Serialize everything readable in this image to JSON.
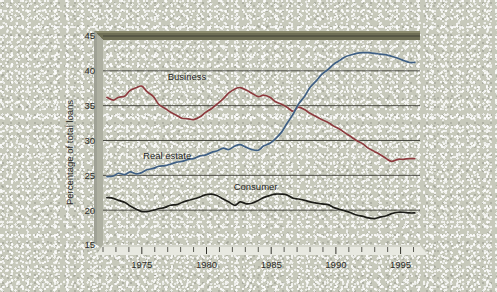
{
  "chart_data": {
    "type": "line",
    "title": "",
    "xlabel": "",
    "ylabel": "Percentage of total loans",
    "xlim": [
      1972,
      1996.5
    ],
    "ylim": [
      15,
      45
    ],
    "ytick_values": [
      15,
      20,
      25,
      30,
      35,
      40,
      45
    ],
    "ytick_labels": [
      "15",
      "20",
      "25",
      "30",
      "35",
      "40",
      "45"
    ],
    "xtick_values": [
      1975,
      1980,
      1985,
      1990,
      1995
    ],
    "xtick_labels": [
      "1975",
      "1980",
      "1985",
      "1990",
      "1995"
    ],
    "xminor_step": 1,
    "grid": "horizontal",
    "legend_position": "inline-annotations",
    "series": [
      {
        "name": "Business",
        "color": "#8c3b3e",
        "label_x": 1977.0,
        "label_y": 38.7,
        "x": [
          1972.3,
          1972.8,
          1973.2,
          1973.7,
          1974.1,
          1974.6,
          1975.0,
          1975.4,
          1975.9,
          1976.3,
          1976.8,
          1977.2,
          1977.7,
          1978.1,
          1978.6,
          1979.0,
          1979.5,
          1979.9,
          1980.4,
          1980.8,
          1981.3,
          1981.7,
          1982.2,
          1982.6,
          1983.1,
          1983.5,
          1984.0,
          1984.4,
          1984.9,
          1985.3,
          1985.8,
          1986.2,
          1986.7,
          1987.1,
          1987.6,
          1988.0,
          1988.5,
          1988.9,
          1989.4,
          1989.8,
          1990.3,
          1990.7,
          1991.2,
          1991.6,
          1992.1,
          1992.5,
          1993.0,
          1993.4,
          1993.9,
          1994.3,
          1994.8,
          1995.2,
          1995.7,
          1996.1
        ],
        "y": [
          36.2,
          35.8,
          36.2,
          36.4,
          37.2,
          37.6,
          37.8,
          37.0,
          36.3,
          35.2,
          34.6,
          34.1,
          33.6,
          33.2,
          33.1,
          33.0,
          33.4,
          34.0,
          34.6,
          35.2,
          36.0,
          36.8,
          37.4,
          37.6,
          37.2,
          36.8,
          36.3,
          36.5,
          36.2,
          35.6,
          35.2,
          34.8,
          34.2,
          34.8,
          34.4,
          33.9,
          33.4,
          33.0,
          32.6,
          32.1,
          31.6,
          31.1,
          30.5,
          30.0,
          29.5,
          28.9,
          28.4,
          28.0,
          27.4,
          27.0,
          27.3,
          27.3,
          27.4,
          27.4
        ]
      },
      {
        "name": "Real estate",
        "color": "#3f5f84",
        "label_x": 1975.1,
        "label_y": 27.4,
        "x": [
          1972.3,
          1972.8,
          1973.2,
          1973.7,
          1974.1,
          1974.6,
          1975.0,
          1975.4,
          1975.9,
          1976.3,
          1976.8,
          1977.2,
          1977.7,
          1978.1,
          1978.6,
          1979.0,
          1979.5,
          1979.9,
          1980.4,
          1980.8,
          1981.3,
          1981.7,
          1982.2,
          1982.6,
          1983.1,
          1983.5,
          1984.0,
          1984.4,
          1984.9,
          1985.3,
          1985.8,
          1986.2,
          1986.7,
          1987.1,
          1987.6,
          1988.0,
          1988.5,
          1988.9,
          1989.4,
          1989.8,
          1990.3,
          1990.7,
          1991.2,
          1991.6,
          1992.1,
          1992.5,
          1993.0,
          1993.4,
          1993.9,
          1994.3,
          1994.8,
          1995.2,
          1995.7,
          1996.1
        ],
        "y": [
          24.8,
          24.9,
          25.3,
          25.1,
          25.5,
          25.2,
          25.4,
          25.8,
          26.0,
          26.3,
          26.4,
          26.6,
          26.9,
          27.0,
          27.3,
          27.4,
          27.8,
          27.9,
          28.3,
          28.5,
          28.9,
          28.7,
          29.2,
          29.4,
          29.0,
          28.7,
          28.6,
          29.2,
          29.6,
          30.2,
          31.2,
          32.4,
          33.8,
          35.2,
          36.4,
          37.6,
          38.6,
          39.5,
          40.2,
          40.9,
          41.5,
          42.0,
          42.3,
          42.5,
          42.6,
          42.6,
          42.5,
          42.4,
          42.3,
          42.1,
          41.8,
          41.5,
          41.2,
          41.2
        ]
      },
      {
        "name": "Consumer",
        "color": "#1d1d18",
        "label_x": 1982.1,
        "label_y": 22.9,
        "x": [
          1972.3,
          1972.8,
          1973.2,
          1973.7,
          1974.1,
          1974.6,
          1975.0,
          1975.4,
          1975.9,
          1976.3,
          1976.8,
          1977.2,
          1977.7,
          1978.1,
          1978.6,
          1979.0,
          1979.5,
          1979.9,
          1980.4,
          1980.8,
          1981.3,
          1981.7,
          1982.2,
          1982.6,
          1983.1,
          1983.5,
          1984.0,
          1984.4,
          1984.9,
          1985.3,
          1985.8,
          1986.2,
          1986.7,
          1987.1,
          1987.6,
          1988.0,
          1988.5,
          1988.9,
          1989.4,
          1989.8,
          1990.3,
          1990.7,
          1991.2,
          1991.6,
          1992.1,
          1992.5,
          1993.0,
          1993.4,
          1993.9,
          1994.3,
          1994.8,
          1995.2,
          1995.7,
          1996.1
        ],
        "y": [
          21.8,
          21.7,
          21.4,
          21.1,
          20.6,
          20.1,
          19.8,
          19.8,
          20.0,
          20.2,
          20.4,
          20.7,
          20.8,
          21.1,
          21.4,
          21.6,
          21.9,
          22.2,
          22.3,
          22.1,
          21.6,
          21.2,
          20.7,
          21.2,
          20.9,
          21.0,
          21.4,
          21.8,
          22.1,
          22.3,
          22.3,
          22.2,
          21.7,
          21.6,
          21.4,
          21.2,
          21.0,
          20.9,
          20.8,
          20.4,
          20.1,
          19.9,
          19.6,
          19.3,
          19.1,
          18.9,
          18.8,
          19.0,
          19.2,
          19.5,
          19.7,
          19.7,
          19.6,
          19.6
        ]
      }
    ]
  },
  "figure": {
    "background_color": "#c7c9bb",
    "gridline_color": "#3a3a33",
    "bevel_top_color": "#6f6f55",
    "bevel_left_color": "#b0b2a4"
  }
}
